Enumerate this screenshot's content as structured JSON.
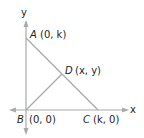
{
  "diagram": {
    "axes": {
      "x_label": "x",
      "y_label": "y",
      "color": "#a7a9ac"
    },
    "segment_color": "#a7a9ac",
    "points": {
      "A": {
        "name": "A",
        "coords": "(0, k)"
      },
      "B": {
        "name": "B",
        "coords": "(0, 0)"
      },
      "C": {
        "name": "C",
        "coords": "(k, 0)"
      },
      "D": {
        "name": "D",
        "coords": "(x, y)"
      }
    },
    "segments": [
      "AC",
      "BD"
    ]
  }
}
